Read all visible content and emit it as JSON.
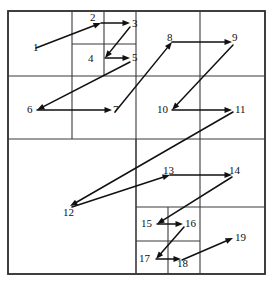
{
  "figure": {
    "type": "diagram",
    "background_color": "#ffffff",
    "line_color": "#3a3a3a",
    "curve_color": "#111111",
    "width": 273,
    "height": 282
  },
  "frame": {
    "left": 8,
    "top": 11,
    "right": 265,
    "bottom": 274
  },
  "grid_lines": [
    {
      "name": "outer-border",
      "x1": 8,
      "y1": 11,
      "x2": 265,
      "y2": 274,
      "kind": "rect"
    },
    {
      "name": "main-vertical-center",
      "x1": 136,
      "y1": 11,
      "x2": 136,
      "y2": 274,
      "kind": "line"
    },
    {
      "name": "main-horizontal-center",
      "x1": 8,
      "y1": 139,
      "x2": 265,
      "y2": 139,
      "kind": "line"
    },
    {
      "name": "q1-horizontal-split",
      "x1": 8,
      "y1": 76,
      "x2": 136,
      "y2": 76,
      "kind": "line"
    },
    {
      "name": "q1-vertical-split",
      "x1": 72,
      "y1": 11,
      "x2": 72,
      "y2": 139,
      "kind": "line"
    },
    {
      "name": "q1a-vertical-split",
      "x1": 104,
      "y1": 11,
      "x2": 104,
      "y2": 76,
      "kind": "line"
    },
    {
      "name": "q1a-horizontal-split",
      "x1": 72,
      "y1": 44,
      "x2": 136,
      "y2": 44,
      "kind": "line"
    },
    {
      "name": "q2-horizontal-split",
      "x1": 136,
      "y1": 76,
      "x2": 265,
      "y2": 76,
      "kind": "line"
    },
    {
      "name": "q2-vertical-split",
      "x1": 200,
      "y1": 11,
      "x2": 200,
      "y2": 139,
      "kind": "line"
    },
    {
      "name": "q4-horizontal-split",
      "x1": 136,
      "y1": 207,
      "x2": 265,
      "y2": 207,
      "kind": "line"
    },
    {
      "name": "q4-vertical-split",
      "x1": 200,
      "y1": 139,
      "x2": 200,
      "y2": 274,
      "kind": "line"
    },
    {
      "name": "q4a-vertical-split",
      "x1": 168,
      "y1": 207,
      "x2": 168,
      "y2": 274,
      "kind": "line"
    },
    {
      "name": "q4a-horizontal-split",
      "x1": 136,
      "y1": 241,
      "x2": 200,
      "y2": 241,
      "kind": "line"
    },
    {
      "name": "q4-left-boundary",
      "x1": 136,
      "y1": 139,
      "x2": 136,
      "y2": 274,
      "kind": "line"
    }
  ],
  "curve": {
    "name": "z-order-traversal",
    "segments": [
      {
        "from": [
          36,
          48
        ],
        "to": [
          101,
          23
        ],
        "arrow": true
      },
      {
        "from": [
          101,
          23
        ],
        "to": [
          130,
          23
        ],
        "arrow": true
      },
      {
        "from": [
          130,
          27
        ],
        "to": [
          105,
          58
        ],
        "arrow": true
      },
      {
        "from": [
          105,
          58
        ],
        "to": [
          130,
          58
        ],
        "arrow": true
      },
      {
        "from": [
          130,
          62
        ],
        "to": [
          37,
          110
        ],
        "arrow": true
      },
      {
        "from": [
          37,
          110
        ],
        "to": [
          112,
          110
        ],
        "arrow": true
      },
      {
        "from": [
          115,
          112
        ],
        "to": [
          172,
          42
        ],
        "arrow": true
      },
      {
        "from": [
          172,
          42
        ],
        "to": [
          232,
          42
        ],
        "arrow": true
      },
      {
        "from": [
          233,
          45
        ],
        "to": [
          172,
          110
        ],
        "arrow": true
      },
      {
        "from": [
          172,
          110
        ],
        "to": [
          232,
          110
        ],
        "arrow": true
      },
      {
        "from": [
          233,
          112
        ],
        "to": [
          70,
          206
        ],
        "arrow": true
      },
      {
        "from": [
          72,
          207
        ],
        "to": [
          170,
          175
        ],
        "arrow": true
      },
      {
        "from": [
          170,
          175
        ],
        "to": [
          232,
          175
        ],
        "arrow": true
      },
      {
        "from": [
          232,
          177
        ],
        "to": [
          157,
          224
        ],
        "arrow": true
      },
      {
        "from": [
          157,
          224
        ],
        "to": [
          183,
          224
        ],
        "arrow": true
      },
      {
        "from": [
          184,
          227
        ],
        "to": [
          156,
          259
        ],
        "arrow": true
      },
      {
        "from": [
          156,
          259
        ],
        "to": [
          181,
          259
        ],
        "arrow": true
      },
      {
        "from": [
          182,
          260
        ],
        "to": [
          233,
          238
        ],
        "arrow": true
      }
    ]
  },
  "nodes": [
    {
      "id": "1",
      "label": "1",
      "x": 33,
      "y": 42
    },
    {
      "id": "2",
      "label": "2",
      "x": 90,
      "y": 12
    },
    {
      "id": "3",
      "label": "3",
      "x": 132,
      "y": 18
    },
    {
      "id": "4",
      "label": "4",
      "x": 88,
      "y": 53
    },
    {
      "id": "5",
      "label": "5",
      "x": 132,
      "y": 52
    },
    {
      "id": "6",
      "label": "6",
      "x": 27,
      "y": 104
    },
    {
      "id": "7",
      "label": "7",
      "x": 113,
      "y": 104
    },
    {
      "id": "8",
      "label": "8",
      "x": 167,
      "y": 32
    },
    {
      "id": "9",
      "label": "9",
      "x": 232,
      "y": 32
    },
    {
      "id": "10",
      "label": "10",
      "x": 157,
      "y": 104
    },
    {
      "id": "11",
      "label": "11",
      "x": 235,
      "y": 104
    },
    {
      "id": "12",
      "label": "12",
      "x": 63,
      "y": 207
    },
    {
      "id": "13",
      "label": "13",
      "x": 163,
      "y": 165
    },
    {
      "id": "14",
      "label": "14",
      "x": 229,
      "y": 165
    },
    {
      "id": "15",
      "label": "15",
      "x": 141,
      "y": 218
    },
    {
      "id": "16",
      "label": "16",
      "x": 185,
      "y": 218
    },
    {
      "id": "17",
      "label": "17",
      "x": 139,
      "y": 253
    },
    {
      "id": "18",
      "label": "18",
      "x": 177,
      "y": 258
    },
    {
      "id": "19",
      "label": "19",
      "x": 235,
      "y": 232
    }
  ]
}
